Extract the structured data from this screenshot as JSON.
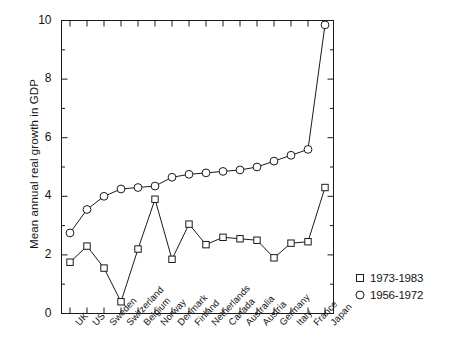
{
  "chart_data": {
    "type": "line",
    "title": "",
    "xlabel": "",
    "ylabel": "Mean annual real growth in GDP",
    "ylim": [
      0,
      10
    ],
    "yticks": [
      0,
      2,
      4,
      6,
      8,
      10
    ],
    "ytick_labels": [
      "0",
      "2",
      "4",
      "6",
      "8",
      "10"
    ],
    "yminor_ticks": [
      1,
      3,
      5,
      7,
      9
    ],
    "grid": false,
    "legend_position": "bottom-right",
    "frame": "box",
    "tick_direction": "in",
    "categories": [
      "UK",
      "US",
      "Sweden",
      "Switzerland",
      "Belgium",
      "Norway",
      "Denmark",
      "Finland",
      "Netherlands",
      "Canada",
      "Australia",
      "Austria",
      "Germany",
      "Italy",
      "France",
      "Japan"
    ],
    "series": [
      {
        "name": "1973-1983",
        "marker": "square",
        "values": [
          1.75,
          2.3,
          1.55,
          0.4,
          2.2,
          3.9,
          1.85,
          3.05,
          2.35,
          2.6,
          2.55,
          2.5,
          1.9,
          2.4,
          2.45,
          4.3
        ]
      },
      {
        "name": "1956-1972",
        "marker": "circle",
        "values": [
          2.75,
          3.55,
          4.0,
          4.25,
          4.3,
          4.35,
          4.65,
          4.75,
          4.8,
          4.85,
          4.9,
          5.0,
          5.2,
          5.4,
          5.6,
          9.85
        ]
      }
    ]
  },
  "legend": {
    "entries": [
      {
        "label": "1973-1983",
        "marker": "square"
      },
      {
        "label": "1956-1972",
        "marker": "circle"
      }
    ]
  },
  "colors": {
    "axis": "#1a1a1a",
    "series_1973_1983": "#1a1a1a",
    "series_1956_1972": "#1a1a1a",
    "background": "#ffffff"
  }
}
